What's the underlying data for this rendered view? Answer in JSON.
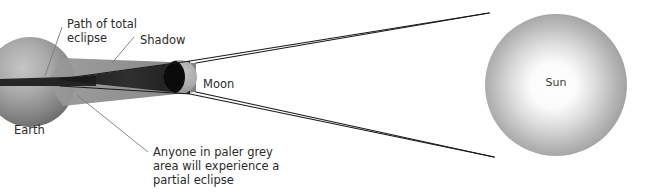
{
  "diagram": {
    "background_color": "#ffffff",
    "width": 647,
    "height": 192
  },
  "bodies": {
    "earth": {
      "label": "Earth",
      "cx": 30,
      "cy": 82,
      "r": 45,
      "color_light": "#b8b8b8",
      "color_dark": "#5e5e5e",
      "label_x": 36,
      "label_y": 129
    },
    "moon": {
      "label": "Moon",
      "cx": 180,
      "cy": 77,
      "r": 17,
      "color_light": "#b2b2b2",
      "color_dark": "#0d0d0d",
      "label_x": 202,
      "label_y": 83
    },
    "sun": {
      "label": "Sun",
      "cx": 556,
      "cy": 85,
      "r": 71,
      "color_center": "#ffffff",
      "color_edge": "#8e8e8e",
      "label_x": 556,
      "label_y": 82
    }
  },
  "shadow": {
    "umbra_color": "#2a2a2a",
    "penumbra_color": "#8c8c8c",
    "umbra_label": "Shadow",
    "penumbra_label": "Path of total eclipse"
  },
  "labels": {
    "path_of_total_eclipse": {
      "line1": "Path of total",
      "line2": "eclipse",
      "x": 64,
      "y": 22
    },
    "shadow": {
      "line1": "Shadow",
      "x": 137,
      "y": 38
    },
    "moon": {
      "line1": "Moon"
    },
    "earth": {
      "line1": "Earth"
    },
    "sun": {
      "line1": "Sun"
    },
    "partial_eclipse_note": {
      "line1": "Anyone in paler grey",
      "line2": "area will experience a",
      "line3": "partial eclipse",
      "x": 152,
      "y": 150
    }
  },
  "colors": {
    "ray_line": "#1a1a1a",
    "leader_line": "#7a7a7a",
    "text": "#2b2b2b"
  }
}
